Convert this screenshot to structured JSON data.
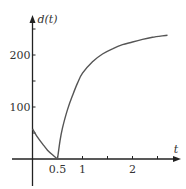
{
  "chart_data": {
    "type": "line",
    "title": "",
    "xlabel": "t",
    "ylabel": "d(t)",
    "xlim": [
      -0.3,
      2.95
    ],
    "ylim": [
      -55,
      275
    ],
    "x_ticks": [
      0.5,
      1,
      1.5,
      2,
      2.5
    ],
    "x_tick_labels": [
      "0.5",
      "1",
      "",
      "2",
      ""
    ],
    "y_ticks": [
      50,
      100,
      150,
      200,
      250
    ],
    "y_tick_labels": [
      "",
      "100",
      "",
      "200",
      ""
    ],
    "grid": false,
    "legend": null,
    "series": [
      {
        "name": "d(t)",
        "points": [
          [
            0,
            58
          ],
          [
            0.1,
            42
          ],
          [
            0.2,
            29
          ],
          [
            0.3,
            17
          ],
          [
            0.4,
            8
          ],
          [
            0.5,
            0
          ],
          [
            0.55,
            35
          ],
          [
            0.6,
            60
          ],
          [
            0.7,
            95
          ],
          [
            0.8,
            122
          ],
          [
            0.9,
            146
          ],
          [
            1.0,
            165
          ],
          [
            1.2,
            187
          ],
          [
            1.4,
            202
          ],
          [
            1.6,
            212
          ],
          [
            1.8,
            220
          ],
          [
            2.0,
            225
          ],
          [
            2.2,
            230
          ],
          [
            2.4,
            234
          ],
          [
            2.7,
            238
          ]
        ]
      }
    ],
    "color": "#555555"
  }
}
